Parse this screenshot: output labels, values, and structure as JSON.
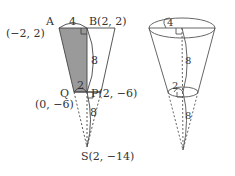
{
  "left_figure": {
    "points": {
      "A": {
        "label": "A",
        "coord": "(−2, 2)"
      },
      "B": {
        "label": "B(2, 2)"
      },
      "P": {
        "label": "P(2, −6)"
      },
      "Q": {
        "label": "Q",
        "coord": "(0, −6)"
      },
      "S": {
        "label": "S(2, −14)"
      }
    },
    "dimensions": {
      "top_width": "4",
      "height_upper": "8",
      "bottom_width": "2",
      "height_lower": "8"
    },
    "colors": {
      "shaded": "#9a9a9a",
      "line": "#444444"
    }
  },
  "right_figure": {
    "dimensions": {
      "top_radius": "4",
      "height_upper": "8",
      "bottom_radius": "2",
      "height_lower": "8"
    }
  }
}
